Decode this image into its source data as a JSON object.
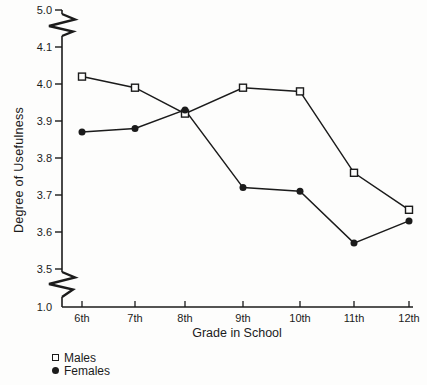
{
  "chart_data": {
    "type": "line",
    "title": "",
    "xlabel": "Grade in School",
    "ylabel": "Degree of Usefulness",
    "categories": [
      "6th",
      "7th",
      "8th",
      "9th",
      "10th",
      "11th",
      "12th"
    ],
    "series": [
      {
        "name": "Males",
        "marker": "open-square",
        "values": [
          4.02,
          3.99,
          3.92,
          3.99,
          3.98,
          3.76,
          3.66
        ]
      },
      {
        "name": "Females",
        "marker": "filled-circle",
        "values": [
          3.87,
          3.88,
          3.93,
          3.72,
          3.71,
          3.57,
          3.63
        ]
      }
    ],
    "y_axis": {
      "tick_values": [
        3.5,
        3.6,
        3.7,
        3.8,
        3.9,
        4.0,
        4.1
      ],
      "tick_labels": [
        "3.5",
        "3.6",
        "3.7",
        "3.8",
        "3.9",
        "4.0",
        "4.1"
      ],
      "top_end_label": "5.0",
      "bottom_end_label": "1.0",
      "has_axis_breaks": true,
      "display_range": [
        3.5,
        4.1
      ]
    },
    "x_axis": {
      "tick_labels": [
        "6th",
        "7th",
        "8th",
        "9th",
        "10th",
        "11th",
        "12th"
      ]
    },
    "legend": {
      "position": "bottom-left",
      "entries": [
        {
          "marker": "open-square",
          "label": "Males"
        },
        {
          "marker": "filled-circle",
          "label": "Females"
        }
      ]
    },
    "grid": false,
    "colors": {
      "ink": "#1b1b1b",
      "background": "#fdfdfc"
    }
  }
}
